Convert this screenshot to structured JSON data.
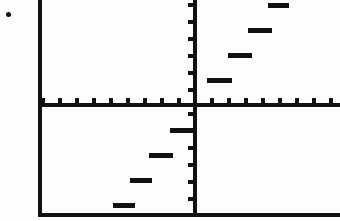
{
  "screen": {
    "width": 340,
    "height": 221,
    "background_color": "#fefefe",
    "ink_color": "#111111",
    "description": "Graphing calculator screen showing a step function"
  },
  "frame": {
    "left_border_x": 38,
    "bottom_border_y": 213,
    "border_thickness": 4,
    "top_open": true,
    "right_open": true
  },
  "artifact": {
    "name": "speck-dot",
    "x": 6,
    "y": 12,
    "size": 5
  },
  "axes": {
    "x_axis_y": 103,
    "y_axis_x": 193,
    "axis_thickness": 4,
    "tick_spacing_x": 17,
    "tick_spacing_y": 17,
    "tick_length_x": 5,
    "tick_length_y": 5,
    "tick_width": 4,
    "x_ticks_x": [
      41,
      58,
      75,
      92,
      109,
      126,
      143,
      160,
      177,
      210,
      227,
      244,
      261,
      278,
      295,
      312,
      329
    ],
    "y_ticks_y": [
      3,
      20,
      37,
      54,
      71,
      88,
      112,
      129,
      146,
      163,
      180,
      197
    ],
    "x_axis_extends_past_right": true
  },
  "chart_data": {
    "type": "line",
    "title": "",
    "subtitle": "",
    "xlabel": "",
    "ylabel": "",
    "style": "step",
    "grid": false,
    "legend": "none",
    "xlim": [
      -9,
      8.6
    ],
    "ylim": [
      -6.5,
      6.0
    ],
    "axis_units": {
      "x_tick_value_step": 1,
      "y_tick_value_step": 1,
      "pixels_per_unit_x": 17,
      "pixels_per_unit_y": 17
    },
    "segments": [
      {
        "index": 1,
        "y_value": -6,
        "x_start": -4.7,
        "x_end": -3.4,
        "px": {
          "x": 113,
          "y": 203,
          "w": 22,
          "h": 5
        }
      },
      {
        "index": 2,
        "y_value": -4,
        "x_start": -3.7,
        "x_end": -2.4,
        "px": {
          "x": 130,
          "y": 178,
          "w": 22,
          "h": 5
        }
      },
      {
        "index": 3,
        "y_value": -3,
        "x_start": -2.6,
        "x_end": -1.2,
        "px": {
          "x": 149,
          "y": 153,
          "w": 24,
          "h": 5
        }
      },
      {
        "index": 4,
        "y_value": -1.5,
        "x_start": -1.4,
        "x_end": 0.1,
        "px": {
          "x": 170,
          "y": 128,
          "w": 25,
          "h": 5
        }
      },
      {
        "index": 5,
        "y_value": 1.5,
        "x_start": 0.8,
        "x_end": 2.3,
        "px": {
          "x": 207,
          "y": 78,
          "w": 25,
          "h": 5
        }
      },
      {
        "index": 6,
        "y_value": 3,
        "x_start": 2.1,
        "x_end": 3.5,
        "px": {
          "x": 228,
          "y": 53,
          "w": 24,
          "h": 5
        }
      },
      {
        "index": 7,
        "y_value": 4.5,
        "x_start": 3.2,
        "x_end": 4.6,
        "px": {
          "x": 248,
          "y": 28,
          "w": 24,
          "h": 5
        }
      },
      {
        "index": 8,
        "y_value": 6,
        "x_start": 4.4,
        "x_end": 5.6,
        "px": {
          "x": 268,
          "y": 3,
          "w": 21,
          "h": 5
        }
      }
    ],
    "x": [
      -4.05,
      -3.05,
      -1.9,
      -0.65,
      1.55,
      2.8,
      3.9,
      5.0
    ],
    "values": [
      -6,
      -4,
      -3,
      -1.5,
      1.5,
      3,
      4.5,
      6
    ]
  }
}
